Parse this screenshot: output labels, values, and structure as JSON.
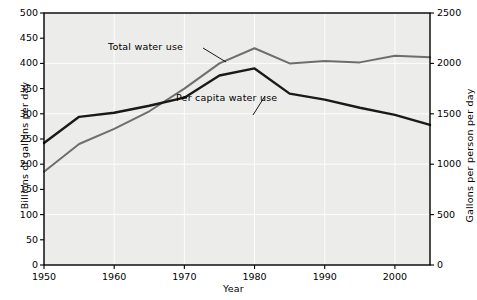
{
  "chart_data": {
    "type": "line",
    "title": "",
    "xlabel": "Year",
    "ylabel": "Billions of gallons per day",
    "ylabel_right": "Gallons per person per day",
    "xlim": [
      1950,
      2005
    ],
    "ylim": [
      0,
      500
    ],
    "ylim_right": [
      0,
      2500
    ],
    "grid": true,
    "legend_position": "inline-annotations",
    "xticks": [
      1950,
      1960,
      1970,
      1980,
      1990,
      2000
    ],
    "xtick_labels": [
      "1950",
      "1960",
      "1970",
      "1980",
      "1990",
      "2000"
    ],
    "yticks": [
      0,
      50,
      100,
      150,
      200,
      250,
      300,
      350,
      400,
      450,
      500
    ],
    "ytick_labels": [
      "0",
      "50",
      "100",
      "150",
      "200",
      "250",
      "300",
      "350",
      "400",
      "450",
      "500"
    ],
    "yticks_right": [
      0,
      500,
      1000,
      1500,
      2000,
      2500
    ],
    "ytick_labels_right": [
      "0",
      "500",
      "1000",
      "1500",
      "2000",
      "2500"
    ],
    "series": [
      {
        "name": "Total water use",
        "axis": "left",
        "units": "billions of gallons per day",
        "color": "#6e6e6e",
        "x": [
          1950,
          1955,
          1960,
          1965,
          1970,
          1975,
          1980,
          1985,
          1990,
          1995,
          2000,
          2005
        ],
        "values": [
          185,
          240,
          270,
          305,
          350,
          400,
          430,
          400,
          405,
          402,
          415,
          412
        ]
      },
      {
        "name": "Per capita water use",
        "axis": "right",
        "units": "gallons per person per day",
        "color": "#1a1a1a",
        "x": [
          1950,
          1955,
          1960,
          1965,
          1970,
          1975,
          1980,
          1985,
          1990,
          1995,
          2000,
          2005
        ],
        "values": [
          1210,
          1470,
          1510,
          1580,
          1660,
          1880,
          1950,
          1700,
          1640,
          1560,
          1490,
          1390
        ]
      }
    ],
    "annotations": [
      {
        "text": "Total water use",
        "target_series": "Total water use"
      },
      {
        "text": "Per capita water use",
        "target_series": "Per capita water use"
      }
    ]
  }
}
